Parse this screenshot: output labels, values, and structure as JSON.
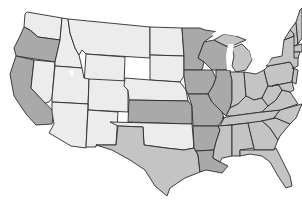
{
  "map": {
    "title": "United States",
    "palette": {
      "light": "#ececec",
      "medium": "#c4c4c4",
      "dark": "#a9a9a9",
      "border": "#2b2b2b",
      "water": "#ffffff"
    },
    "states": [
      {
        "id": "WA",
        "name": "Washington",
        "shade": "light",
        "points": "27,12 62,18 60,40 38,37 30,30 24,27 25,14"
      },
      {
        "id": "OR",
        "name": "Oregon",
        "shade": "dark",
        "points": "24,27 30,30 38,37 60,40 55,62 16,56 14,48 20,36"
      },
      {
        "id": "CA",
        "name": "California",
        "shade": "dark",
        "points": "16,56 34,60 31,88 54,112 52,124 36,125 26,114 14,96 10,74"
      },
      {
        "id": "NV",
        "name": "Nevada",
        "shade": "light",
        "points": "34,60 55,62 52,98 49,102 45,103 31,88"
      },
      {
        "id": "ID",
        "name": "Idaho",
        "shade": "light",
        "points": "62,18 68,19 70,33 75,48 79,55 82,68 55,66 55,62 60,40"
      },
      {
        "id": "MT",
        "name": "Montana",
        "shade": "light",
        "points": "68,19 150,27 150,58 86,54 82,50 79,55 75,48 70,33"
      },
      {
        "id": "WY",
        "name": "Wyoming",
        "shade": "light",
        "points": "86,54 125,57 124,86 84,84"
      },
      {
        "id": "UT",
        "name": "Utah",
        "shade": "light",
        "points": "55,66 82,68 84,78 89,79 88,104 52,102 52,98"
      },
      {
        "id": "CO",
        "name": "Colorado",
        "shade": "light",
        "points": "89,79 128,81 128,112 88,110"
      },
      {
        "id": "AZ",
        "name": "Arizona",
        "shade": "light",
        "points": "52,102 88,104 86,148 71,146 49,133 54,124 52,112"
      },
      {
        "id": "NM",
        "name": "New Mexico",
        "shade": "light",
        "points": "88,110 118,112 116,145 96,145 96,147 86,147"
      },
      {
        "id": "ND",
        "name": "North Dakota",
        "shade": "light",
        "points": "150,27 151,27 182,28 184,56 150,55"
      },
      {
        "id": "SD",
        "name": "South Dakota",
        "shade": "light",
        "points": "150,55 184,56 184,76 180,82 150,80"
      },
      {
        "id": "NE",
        "name": "Nebraska",
        "shade": "light",
        "points": "125,78 150,80 180,82 186,90 188,101 129,100 128,90 124,86"
      },
      {
        "id": "KS",
        "name": "Kansas",
        "shade": "dark",
        "points": "129,100 188,101 192,106 192,124 128,122"
      },
      {
        "id": "OK",
        "name": "Oklahoma",
        "shade": "light",
        "points": "110,122 192,124 194,148 184,150 166,148 144,145 143,127 118,126"
      },
      {
        "id": "TX",
        "name": "Texas",
        "shade": "medium",
        "points": "118,126 143,127 144,145 166,148 184,150 194,148 198,155 200,172 185,178 170,188 167,196 155,186 145,170 130,160 112,150 96,145 116,145"
      },
      {
        "id": "MN",
        "name": "Minnesota",
        "shade": "dark",
        "points": "182,28 200,28 205,30 218,32 204,42 198,58 204,62 202,70 184,70 184,56"
      },
      {
        "id": "IA",
        "name": "Iowa",
        "shade": "dark",
        "points": "184,70 212,70 216,78 213,86 208,94 188,94 186,90 184,76"
      },
      {
        "id": "MO",
        "name": "Missouri",
        "shade": "dark",
        "points": "188,94 208,94 212,102 222,112 224,118 218,126 193,126 192,106"
      },
      {
        "id": "AR",
        "name": "Arkansas",
        "shade": "dark",
        "points": "193,126 218,126 220,130 216,142 214,150 196,151 194,148"
      },
      {
        "id": "LA",
        "name": "Louisiana",
        "shade": "dark",
        "points": "196,151 214,150 213,158 220,162 228,166 222,173 206,170 200,172 198,155"
      },
      {
        "id": "WI",
        "name": "Wisconsin",
        "shade": "dark",
        "points": "204,42 214,40 226,46 230,50 228,62 228,70 216,70 212,70 204,62 198,58"
      },
      {
        "id": "IL",
        "name": "Illinois",
        "shade": "dark",
        "points": "216,70 230,70 232,80 232,100 230,108 226,116 222,112 212,102 208,94 213,86 216,78"
      },
      {
        "id": "MI",
        "name": "Michigan",
        "shade": "medium",
        "points": "232,48 242,44 250,52 252,60 246,70 236,72 232,66 234,56"
      },
      {
        "id": "MIUP",
        "name": "Michigan Upper Peninsula",
        "shade": "medium",
        "points": "214,40 224,34 236,36 246,40 232,46 226,46"
      },
      {
        "id": "IN",
        "name": "Indiana",
        "shade": "medium",
        "points": "230,72 244,72 246,96 238,104 230,108 232,100 232,80"
      },
      {
        "id": "OH",
        "name": "Ohio",
        "shade": "medium",
        "points": "244,72 256,74 264,70 268,86 262,98 254,100 246,96"
      },
      {
        "id": "KY",
        "name": "Kentucky",
        "shade": "medium",
        "points": "226,116 230,108 238,104 246,96 254,100 262,98 268,106 262,112 232,116"
      },
      {
        "id": "TN",
        "name": "Tennessee",
        "shade": "medium",
        "points": "222,118 232,116 262,112 280,110 274,118 258,122 220,126 224,118"
      },
      {
        "id": "MS",
        "name": "Mississippi",
        "shade": "medium",
        "points": "218,126 232,125 232,156 222,158 220,162 213,158 214,150 216,142 220,130"
      },
      {
        "id": "AL",
        "name": "Alabama",
        "shade": "medium",
        "points": "232,125 248,123 254,148 240,150 240,156 232,156"
      },
      {
        "id": "GA",
        "name": "Georgia",
        "shade": "medium",
        "points": "248,123 262,121 270,128 278,140 274,150 254,150 254,148"
      },
      {
        "id": "FL",
        "name": "Florida",
        "shade": "medium",
        "points": "240,150 254,150 274,150 276,148 282,160 290,176 292,186 286,188 278,176 270,162 262,156 250,154 240,156"
      },
      {
        "id": "SC",
        "name": "South Carolina",
        "shade": "medium",
        "points": "262,121 276,118 290,124 280,136 278,140 270,128"
      },
      {
        "id": "NC",
        "name": "North Carolina",
        "shade": "medium",
        "points": "274,118 280,110 302,104 296,118 290,124 276,118"
      },
      {
        "id": "VA",
        "name": "Virginia",
        "shade": "medium",
        "points": "262,112 268,106 276,100 282,90 290,92 298,104 280,110"
      },
      {
        "id": "WV",
        "name": "West Virginia",
        "shade": "medium",
        "points": "262,98 268,86 272,86 278,84 282,90 276,100 268,106"
      },
      {
        "id": "PA",
        "name": "Pennsylvania",
        "shade": "medium",
        "points": "264,70 268,66 290,62 294,68 292,82 272,86 268,86"
      },
      {
        "id": "NY",
        "name": "New York",
        "shade": "medium",
        "points": "266,66 272,58 282,56 284,40 294,36 298,54 298,66 294,68 290,62 268,66"
      },
      {
        "id": "MD",
        "name": "Maryland",
        "shade": "medium",
        "points": "272,86 292,82 294,90 290,92 282,90 278,84"
      },
      {
        "id": "NJ",
        "name": "New Jersey",
        "shade": "medium",
        "points": "292,68 298,70 296,84 292,82 294,68"
      },
      {
        "id": "VT",
        "name": "Vermont",
        "shade": "medium",
        "points": "284,40 290,30 294,34 294,36"
      },
      {
        "id": "NH",
        "name": "New Hampshire",
        "shade": "medium",
        "points": "290,30 296,22 298,44 294,46 294,34"
      },
      {
        "id": "ME",
        "name": "Maine",
        "shade": "medium",
        "points": "296,22 300,10 302,8 302,38 298,44"
      },
      {
        "id": "MA",
        "name": "Massachusetts",
        "shade": "medium",
        "points": "294,46 302,44 302,52 294,52"
      },
      {
        "id": "CT",
        "name": "Connecticut",
        "shade": "medium",
        "points": "294,52 300,52 298,58 294,58"
      }
    ],
    "lakes": [
      {
        "id": "lake-michigan",
        "name": "Lake Michigan",
        "points": "228,44 234,44 232,56 230,70 227,70 226,56"
      },
      {
        "id": "lake-superior",
        "name": "Lake Superior",
        "points": "212,34 224,26 240,28 246,34 236,36 224,34 214,38"
      },
      {
        "id": "lake-huron",
        "name": "Lake Huron",
        "points": "248,36 258,42 256,56 252,60 250,52 244,44"
      },
      {
        "id": "lake-erie",
        "name": "Lake Erie",
        "points": "252,66 270,60 268,64 256,70"
      },
      {
        "id": "great-salt-lake",
        "name": "Great Salt Lake",
        "points": "69,71 73,70 74,75 71,76"
      }
    ]
  }
}
